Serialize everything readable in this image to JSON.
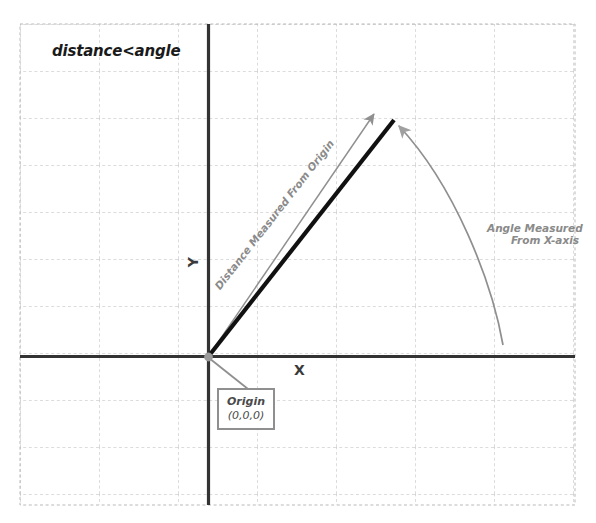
{
  "diagram": {
    "title": "distance<angle",
    "axes": {
      "x_label": "X",
      "y_label": "Y"
    },
    "annotations": {
      "distance": "Distance Measured From Origin",
      "angle_line1": "Angle Measured",
      "angle_line2": "From X-axis"
    },
    "origin_callout": {
      "title": "Origin",
      "coords": "(0,0,0)"
    },
    "colors": {
      "background": "#ffffff",
      "grid_line": "#b9b9b9",
      "axis_line": "#333333",
      "vector_black": "#111111",
      "annotation_gray": "#8a8a8a",
      "box_border": "#8f8f8f",
      "origin_dot": "#9a9a9a",
      "title_text": "#1a1a1a"
    },
    "geometry": {
      "grid_left": 20,
      "grid_top": 24,
      "grid_right": 575,
      "grid_bottom": 505,
      "grid_cell_width": 79,
      "grid_cell_height": 47,
      "origin_x": 208,
      "origin_y": 357,
      "vector_tip_x": 394,
      "vector_tip_y": 120,
      "gray_arrow_tip_x": 372,
      "gray_arrow_tip_y": 112,
      "arc_start_x": 503,
      "arc_start_y": 345,
      "arc_end_x": 396,
      "arc_end_y": 122
    }
  }
}
